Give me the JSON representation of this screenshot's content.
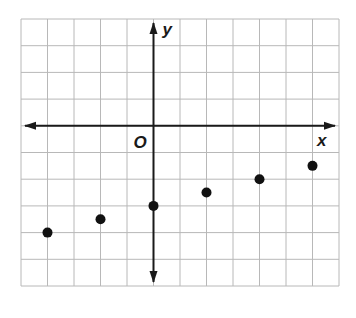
{
  "chart_data": {
    "type": "scatter",
    "title": "",
    "xlabel": "x",
    "ylabel": "y",
    "origin_label": "O",
    "xlim": [
      -5,
      7
    ],
    "ylim": [
      -6,
      4
    ],
    "grid": true,
    "tick_labels": false,
    "points": [
      {
        "x": -4,
        "y": -4
      },
      {
        "x": -2,
        "y": -3.5
      },
      {
        "x": 0,
        "y": -3
      },
      {
        "x": 2,
        "y": -2.5
      },
      {
        "x": 4,
        "y": -2
      },
      {
        "x": 6,
        "y": -1.5
      }
    ],
    "x": [
      -4,
      -2,
      0,
      2,
      4,
      6
    ],
    "values": [
      -4,
      -3.5,
      -3,
      -2.5,
      -2,
      -1.5
    ]
  },
  "colors": {
    "grid": "#b8b8b8",
    "axis": "#1a1a1a",
    "point": "#111111",
    "background": "#ffffff"
  },
  "layout": {
    "grid_left": 21,
    "grid_top": 19,
    "cell_w": 26.5,
    "cell_h": 26.7
  }
}
